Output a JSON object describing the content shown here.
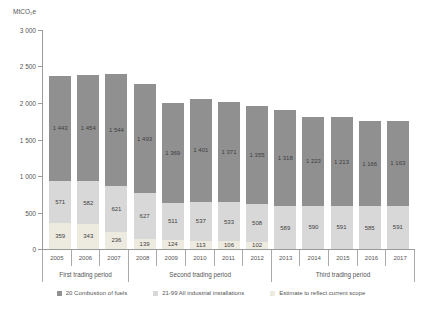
{
  "chart_data": {
    "type": "bar",
    "stacked": true,
    "title": "",
    "ylabel": "MtCO₂e",
    "xlabel": "",
    "ylim": [
      0,
      3000
    ],
    "grid": false,
    "legend_position": "bottom",
    "yticks": [
      0,
      500,
      1000,
      1500,
      2000,
      2500,
      3000
    ],
    "ytick_labels": [
      "0",
      "500",
      "1 000",
      "1 500",
      "2 000",
      "2 500",
      "3 000"
    ],
    "categories": [
      "2005",
      "2006",
      "2007",
      "2008",
      "2009",
      "2010",
      "2011",
      "2012",
      "2013",
      "2014",
      "2015",
      "2016",
      "2017"
    ],
    "series": [
      {
        "key": "combustion",
        "name": "20 Combustion of fuels",
        "color": "#909090",
        "values": [
          1443,
          1454,
          1544,
          1493,
          1369,
          1401,
          1371,
          1355,
          1318,
          1223,
          1213,
          1166,
          1163
        ]
      },
      {
        "key": "industrial",
        "name": "21-99 All industrial installations",
        "color": "#d8d8d8",
        "values": [
          571,
          582,
          621,
          627,
          511,
          537,
          533,
          508,
          589,
          590,
          591,
          585,
          591
        ]
      },
      {
        "key": "estimate",
        "name": "Estimate to reflect current scope",
        "color": "#edeae0",
        "values": [
          359,
          343,
          236,
          139,
          124,
          113,
          106,
          102,
          0,
          0,
          0,
          0,
          0
        ]
      }
    ],
    "groups": [
      {
        "label": "First trading period",
        "span": 3
      },
      {
        "label": "Second trading period",
        "span": 5
      },
      {
        "label": "Third trading period",
        "span": 5
      }
    ]
  }
}
